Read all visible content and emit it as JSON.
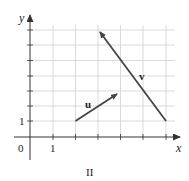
{
  "figure": {
    "caption": "II",
    "axes": {
      "x_label": "x",
      "y_label": "y",
      "origin_label": "0",
      "x_tick_label": "1",
      "y_tick_label": "1",
      "x_range": [
        0,
        6.5
      ],
      "y_range": [
        0,
        7.5
      ],
      "grid": true
    },
    "vectors": [
      {
        "name": "u",
        "label": "u",
        "from": [
          2,
          1
        ],
        "to": [
          4,
          3
        ]
      },
      {
        "name": "v",
        "label": "v",
        "from": [
          6,
          1
        ],
        "to": [
          3,
          7
        ]
      }
    ],
    "colors": {
      "grid": "#d0d0d0",
      "axis": "#333333",
      "vector": "#444444",
      "text": "#222222"
    }
  }
}
